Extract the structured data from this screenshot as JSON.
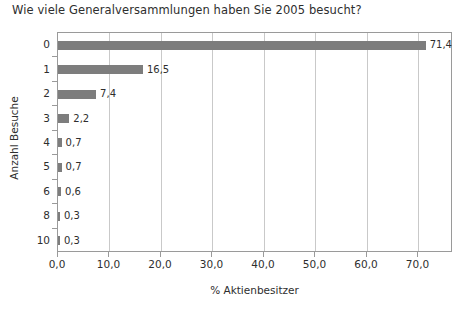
{
  "chart_data": {
    "type": "bar",
    "orientation": "horizontal",
    "title": "Wie viele Generalversammlungen haben Sie 2005 besucht?",
    "xlabel": "% Aktienbesitzer",
    "ylabel": "Anzahl Besuche",
    "categories": [
      "0",
      "1",
      "2",
      "3",
      "4",
      "5",
      "6",
      "8",
      "10"
    ],
    "values": [
      71.4,
      16.5,
      7.4,
      2.2,
      0.7,
      0.7,
      0.6,
      0.3,
      0.3
    ],
    "value_labels": [
      "71,4",
      "16,5",
      "7,4",
      "2,2",
      "0,7",
      "0,7",
      "0,6",
      "0,3",
      "0,3"
    ],
    "xlim": [
      0,
      76.7
    ],
    "xticks": [
      0,
      10,
      20,
      30,
      40,
      50,
      60,
      70
    ],
    "xtick_labels": [
      "0,0",
      "10,0",
      "20,0",
      "30,0",
      "40,0",
      "50,0",
      "60,0",
      "70,0"
    ],
    "grid": "vertical",
    "legend": "none",
    "bar_color": "#7d7d7d",
    "frame_color": "#9a9a9a",
    "gridline_color": "#c9c9c9",
    "background": "#ffffff"
  }
}
